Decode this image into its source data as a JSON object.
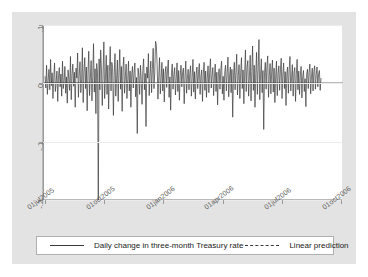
{
  "chart_data": {
    "type": "line",
    "title": "",
    "xlabel": "date",
    "ylabel": "",
    "grid": true,
    "legend_position": "bottom",
    "xlim": [
      "01jul2005",
      "01oct2006"
    ],
    "ylim": [
      -0.2,
      0.1
    ],
    "yticks": [
      ".1",
      "0",
      "-.1",
      "-.2"
    ],
    "ytick_values": [
      0.1,
      0,
      -0.1,
      -0.2
    ],
    "xticks": [
      "01jul2005",
      "01oct2005",
      "01jan2006",
      "01apr2006",
      "01jul2006",
      "01oct2006"
    ],
    "series": [
      {
        "name": "Daily change in three-month Treasury rate",
        "style": "solid",
        "color": "#3a3a3a",
        "values": [
          0.012,
          -0.008,
          0.031,
          -0.019,
          0.006,
          0.024,
          -0.011,
          0.041,
          -0.004,
          0.018,
          -0.026,
          0.009,
          0.035,
          -0.014,
          0.002,
          0.021,
          -0.031,
          0.013,
          0.027,
          -0.006,
          0.016,
          -0.022,
          0.038,
          -0.009,
          0.004,
          0.029,
          -0.017,
          0.011,
          -0.034,
          0.023,
          0.007,
          -0.012,
          0.046,
          -0.028,
          0.015,
          0.033,
          -0.005,
          0.019,
          -0.041,
          0.026,
          0.009,
          0.052,
          -0.024,
          0.014,
          0.037,
          -0.016,
          0.006,
          0.061,
          -0.033,
          0.021,
          0.044,
          -0.009,
          0.028,
          -0.047,
          0.017,
          0.055,
          -0.021,
          0.008,
          0.039,
          -0.03,
          0.012,
          0.068,
          -0.015,
          0.025,
          -0.052,
          0.034,
          0.018,
          -0.2,
          0.042,
          -0.011,
          0.057,
          0.023,
          -0.038,
          0.016,
          0.071,
          -0.026,
          0.009,
          0.048,
          -0.019,
          0.031,
          -0.044,
          0.02,
          0.063,
          -0.013,
          0.036,
          0.027,
          -0.055,
          0.014,
          0.051,
          -0.022,
          0.008,
          0.04,
          -0.031,
          0.019,
          0.058,
          -0.01,
          0.029,
          -0.048,
          0.023,
          0.045,
          -0.017,
          0.011,
          0.033,
          -0.026,
          0.006,
          0.038,
          -0.013,
          0.021,
          -0.041,
          0.015,
          0.029,
          -0.008,
          0.018,
          0.035,
          -0.023,
          0.01,
          -0.086,
          0.026,
          0.013,
          -0.019,
          0.031,
          0.007,
          -0.036,
          0.022,
          0.042,
          -0.011,
          0.017,
          -0.074,
          0.028,
          0.009,
          0.051,
          -0.021,
          0.014,
          0.038,
          -0.016,
          0.024,
          0.06,
          -0.009,
          0.019,
          0.072,
          0.065,
          0.031,
          -0.027,
          0.012,
          0.044,
          -0.018,
          0.008,
          0.036,
          -0.013,
          0.025,
          -0.032,
          0.016,
          0.029,
          -0.007,
          0.021,
          0.04,
          -0.024,
          0.011,
          -0.046,
          0.018,
          0.033,
          -0.01,
          0.015,
          0.027,
          -0.02,
          0.009,
          0.035,
          -0.014,
          0.022,
          -0.029,
          0.013,
          0.031,
          -0.006,
          0.019,
          0.026,
          -0.035,
          0.012,
          0.038,
          -0.017,
          0.008,
          0.024,
          -0.011,
          0.016,
          0.03,
          -0.022,
          0.01,
          0.041,
          -0.015,
          0.02,
          -0.027,
          0.014,
          0.028,
          -0.009,
          0.017,
          0.034,
          -0.019,
          0.011,
          0.023,
          -0.031,
          0.015,
          0.036,
          -0.012,
          0.021,
          -0.024,
          0.009,
          0.03,
          -0.016,
          0.018,
          0.042,
          -0.008,
          0.013,
          0.027,
          -0.021,
          0.01,
          0.033,
          -0.014,
          0.019,
          -0.037,
          0.016,
          0.025,
          -0.01,
          0.022,
          0.038,
          -0.018,
          0.012,
          -0.029,
          0.02,
          0.031,
          -0.013,
          0.017,
          0.045,
          -0.023,
          0.011,
          0.028,
          -0.016,
          0.024,
          -0.058,
          0.014,
          0.036,
          -0.011,
          0.019,
          0.05,
          -0.02,
          0.013,
          0.032,
          -0.026,
          0.018,
          0.044,
          -0.009,
          0.023,
          -0.035,
          0.016,
          0.057,
          -0.014,
          0.027,
          0.039,
          -0.022,
          0.011,
          0.048,
          -0.03,
          0.02,
          0.064,
          -0.012,
          0.031,
          -0.041,
          0.017,
          0.053,
          -0.019,
          0.025,
          0.075,
          -0.028,
          0.014,
          0.042,
          -0.016,
          0.022,
          -0.079,
          0.018,
          0.036,
          -0.01,
          0.029,
          0.047,
          -0.024,
          0.013,
          0.034,
          -0.018,
          0.021,
          0.04,
          -0.015,
          0.026,
          -0.033,
          0.011,
          0.038,
          -0.021,
          0.017,
          0.03,
          -0.012,
          0.023,
          0.043,
          -0.026,
          0.014,
          0.035,
          -0.009,
          0.02,
          -0.038,
          0.016,
          0.028,
          -0.017,
          0.024,
          0.046,
          -0.013,
          0.01,
          0.032,
          -0.022,
          0.018,
          0.027,
          -0.031,
          0.015,
          0.041,
          -0.011,
          0.021,
          -0.019,
          0.013,
          0.029,
          -0.025,
          0.012,
          0.022,
          -0.014,
          0.008,
          -0.04,
          0.016,
          0.024,
          -0.009,
          0.019,
          0.033,
          -0.018,
          0.011,
          0.026,
          -0.013,
          0.02,
          0.03,
          -0.01,
          0.015,
          0.028,
          -0.006,
          0.017,
          0.022,
          -0.012,
          0.009
        ]
      },
      {
        "name": "Linear prediction",
        "style": "dashed",
        "color": "#6f6f6f",
        "values": [
          0.001,
          0.0005
        ]
      }
    ]
  },
  "axis": {
    "x_title": "date",
    "y_ticks": [
      ".1",
      "0",
      "-.1",
      "-.2"
    ],
    "x_ticks": [
      "01jul2005",
      "01oct2005",
      "01jan2006",
      "01apr2006",
      "01jul2006",
      "01oct2006"
    ]
  },
  "legend": {
    "entries": [
      {
        "label": "Daily change in three-month Treasury rate",
        "style": "solid"
      },
      {
        "label": "Linear prediction",
        "style": "dashed"
      }
    ]
  },
  "colors": {
    "figure_background": "#e3e3e3",
    "plot_background": "#ffffff",
    "series_line": "#3a3a3a",
    "prediction_line": "#6f6f6f",
    "grid": "#eceaea",
    "axis": "#9a9a9a"
  }
}
